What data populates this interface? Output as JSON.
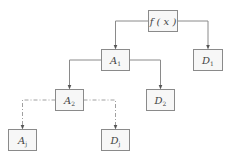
{
  "diagram": {
    "type": "tree",
    "nodes": [
      {
        "id": "fx",
        "label": "f ( x )",
        "main": "f ( x )",
        "sub": ""
      },
      {
        "id": "A1",
        "label": "A1",
        "main": "A",
        "sub": "1"
      },
      {
        "id": "D1",
        "label": "D1",
        "main": "D",
        "sub": "1"
      },
      {
        "id": "A2",
        "label": "A2",
        "main": "A",
        "sub": "2"
      },
      {
        "id": "D2",
        "label": "D2",
        "main": "D",
        "sub": "2"
      },
      {
        "id": "Aj",
        "label": "Aj",
        "main": "A",
        "sub": "j"
      },
      {
        "id": "Dj",
        "label": "Dj",
        "main": "D",
        "sub": "j"
      }
    ],
    "edges": [
      {
        "from": "fx",
        "to": "A1",
        "style": "solid"
      },
      {
        "from": "fx",
        "to": "D1",
        "style": "solid"
      },
      {
        "from": "A1",
        "to": "A2",
        "style": "solid"
      },
      {
        "from": "A1",
        "to": "D2",
        "style": "solid"
      },
      {
        "from": "A2",
        "to": "Aj",
        "style": "dash-dot"
      },
      {
        "from": "A2",
        "to": "Dj",
        "style": "dash-dot"
      }
    ],
    "colors": {
      "box_fill": "#f7f7f7",
      "box_stroke": "#8a8a8a",
      "text": "#444444",
      "arrow": "#555555"
    }
  }
}
